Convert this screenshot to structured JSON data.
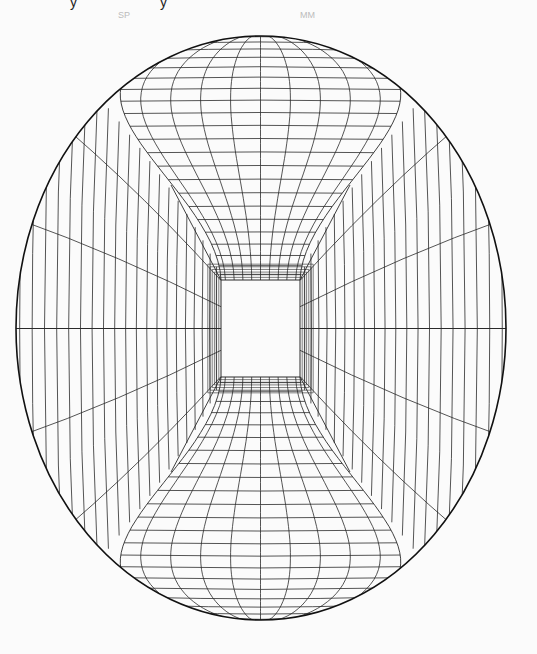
{
  "figure": {
    "type": "optical-illusion-line-drawing",
    "background": "#fbfbfb",
    "stroke_color": "#2a2a2a",
    "outline_color": "#111111",
    "outer_ellipse": {
      "cx": 261,
      "cy": 328,
      "rx": 245,
      "ry": 292
    },
    "inner_square": {
      "x1": 221,
      "y1": 280,
      "x2": 300,
      "y2": 377
    },
    "top_funnel": {
      "vertical_curves": 9,
      "horizontal_rungs": 22
    },
    "bottom_funnel": {
      "vertical_curves": 9,
      "horizontal_rungs": 22
    },
    "side_panels": {
      "vertical_arcs": 20,
      "radial_lines": 4
    }
  },
  "top_fragments": [
    {
      "x": 70,
      "text": "y"
    },
    {
      "x": 160,
      "text": "y"
    }
  ],
  "ghost_text": [
    {
      "x": 118,
      "text": "SP"
    },
    {
      "x": 300,
      "text": "MM"
    }
  ]
}
